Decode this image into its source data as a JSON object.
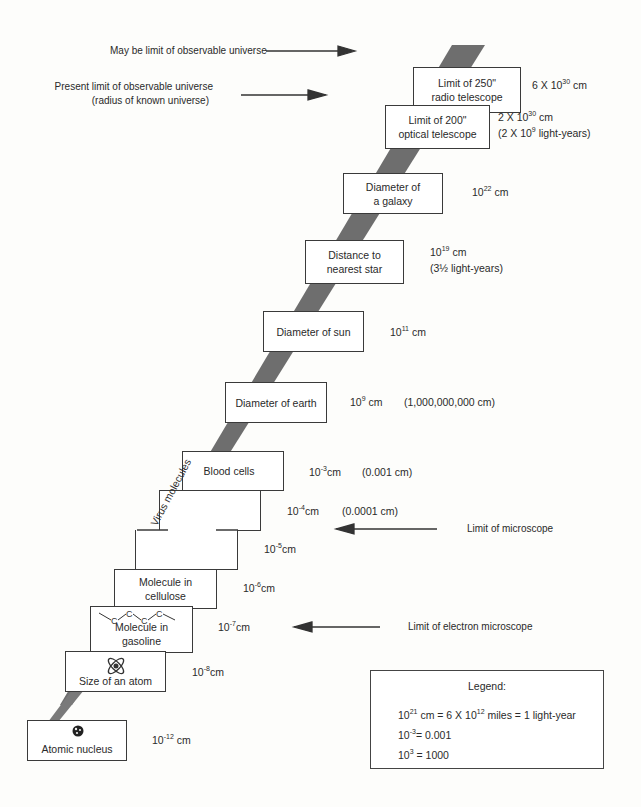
{
  "annotations": {
    "may_be_limit": "May be limit of observable universe",
    "present_limit_line1": "Present limit of observable universe",
    "present_limit_line2": "(radius of known universe)",
    "limit_microscope": "Limit of microscope",
    "limit_electron_microscope": "Limit of electron microscope"
  },
  "steps": [
    {
      "id": "radio-telescope",
      "lines": [
        "Limit of 250\"",
        "radio telescope"
      ],
      "size_base": "6 X 10",
      "size_exp": "30",
      "size_unit": " cm",
      "note": ""
    },
    {
      "id": "optical-telescope",
      "lines": [
        "Limit of 200\"",
        "optical telescope"
      ],
      "size_base": "2 X 10",
      "size_exp": "30",
      "size_unit": " cm",
      "note_base": "(2 X 10",
      "note_exp": "9",
      "note_unit": " light-years)"
    },
    {
      "id": "galaxy",
      "lines": [
        "Diameter of",
        "a galaxy"
      ],
      "size_base": "10",
      "size_exp": "22",
      "size_unit": " cm"
    },
    {
      "id": "nearest-star",
      "lines": [
        "Distance to",
        "nearest star"
      ],
      "size_base": "10",
      "size_exp": "19",
      "size_unit": " cm",
      "note": "(3½ light-years)"
    },
    {
      "id": "sun",
      "lines": [
        "Diameter of sun"
      ],
      "size_base": "10",
      "size_exp": "11",
      "size_unit": " cm"
    },
    {
      "id": "earth",
      "lines": [
        "Diameter of earth"
      ],
      "size_base": "10",
      "size_exp": "9",
      "size_unit": " cm",
      "note": "(1,000,000,000 cm)"
    },
    {
      "id": "blood-cells",
      "lines": [
        "Blood cells"
      ],
      "size_base": "10",
      "size_exp": "-3",
      "size_unit": "cm",
      "note": "(0.001 cm)"
    },
    {
      "id": "virus-molecules",
      "lines": [
        "Virus molecules"
      ],
      "size_base": "10",
      "size_exp": "-4",
      "size_unit": "cm",
      "note": "(0.0001 cm)",
      "size2_base": "10",
      "size2_exp": "-5",
      "size2_unit": "cm"
    },
    {
      "id": "cellulose",
      "lines": [
        "Molecule in",
        "cellulose"
      ],
      "size_base": "10",
      "size_exp": "-6",
      "size_unit": "cm"
    },
    {
      "id": "gasoline",
      "lines": [
        "Molecule in",
        "gasoline"
      ],
      "formula": "C C C C",
      "size_base": "10",
      "size_exp": "-7",
      "size_unit": "cm"
    },
    {
      "id": "atom",
      "lines": [
        "Size of an atom"
      ],
      "size_base": "10",
      "size_exp": "-8",
      "size_unit": "cm"
    },
    {
      "id": "nucleus",
      "lines": [
        "Atomic nucleus"
      ],
      "size_base": "10",
      "size_exp": "-12",
      "size_unit": " cm"
    }
  ],
  "legend": {
    "title": "Legend:",
    "row1_a": "10",
    "row1_a_exp": "21",
    "row1_b": " cm = 6 X 10",
    "row1_b_exp": "12",
    "row1_c": " miles = 1 light-year",
    "row2_a": "10",
    "row2_a_exp": "-3",
    "row2_b": "= 0.001",
    "row3_a": "10",
    "row3_a_exp": "3",
    "row3_b": " = 1000"
  },
  "colors": {
    "band": "#6e6e6e",
    "box_border": "#3a3a3a",
    "text": "#2a2a2a"
  }
}
